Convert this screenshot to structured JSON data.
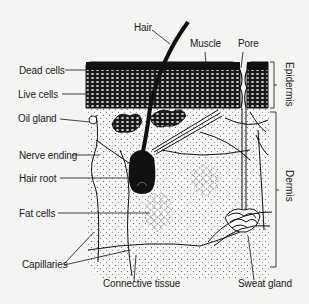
{
  "diagram": {
    "colors": {
      "ink": "#111111",
      "paper": "#f4f4f2",
      "dots": "#555555"
    },
    "labels": {
      "hair": "Hair",
      "muscle": "Muscle",
      "pore": "Pore",
      "dead_cells": "Dead cells",
      "live_cells": "Live cells",
      "oil_gland": "Oil gland",
      "nerve_ending": "Nerve ending",
      "hair_root": "Hair root",
      "fat_cells": "Fat cells",
      "capillaries": "Capillaries",
      "connective_tissue": "Connective tissue",
      "sweat_gland": "Sweat gland",
      "epidermis": "Epidermis",
      "dermis": "Dermis"
    }
  }
}
